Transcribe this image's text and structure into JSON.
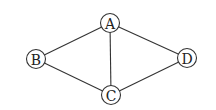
{
  "diagram": {
    "type": "undirected-graph",
    "nodes": [
      {
        "id": "A",
        "label": "A"
      },
      {
        "id": "B",
        "label": "B"
      },
      {
        "id": "C",
        "label": "C"
      },
      {
        "id": "D",
        "label": "D"
      }
    ],
    "edges": [
      {
        "from": "A",
        "to": "B"
      },
      {
        "from": "A",
        "to": "C"
      },
      {
        "from": "A",
        "to": "D"
      },
      {
        "from": "B",
        "to": "C"
      },
      {
        "from": "C",
        "to": "D"
      }
    ]
  }
}
